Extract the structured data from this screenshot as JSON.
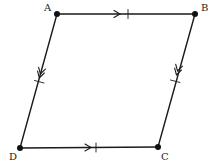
{
  "diagram": {
    "type": "parallelogram",
    "colors": {
      "stroke": "#1a1a1a",
      "label": "#222222",
      "background": "#ffffff"
    },
    "vertices": [
      {
        "id": "A",
        "label": "A",
        "x": 57,
        "y": 14,
        "lx": 44,
        "ly": 11
      },
      {
        "id": "B",
        "label": "B",
        "x": 195,
        "y": 14,
        "lx": 201,
        "ly": 11
      },
      {
        "id": "C",
        "label": "C",
        "x": 158,
        "y": 147,
        "lx": 161,
        "ly": 160
      },
      {
        "id": "D",
        "label": "D",
        "x": 20,
        "y": 148,
        "lx": 9,
        "ly": 160
      }
    ],
    "edges": [
      {
        "from": "A",
        "to": "B",
        "marking": "single-arrow, single-tick"
      },
      {
        "from": "B",
        "to": "C",
        "marking": "double-arrow, single-tick"
      },
      {
        "from": "C",
        "to": "D",
        "marking": "single-arrow, single-tick"
      },
      {
        "from": "D",
        "to": "A",
        "marking": "double-arrow, single-tick"
      }
    ]
  }
}
